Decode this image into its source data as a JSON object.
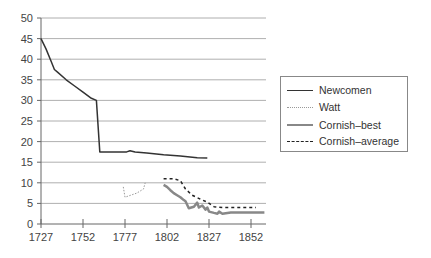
{
  "chart_data": {
    "type": "line",
    "title": "",
    "xlabel": "",
    "ylabel": "",
    "xlim": [
      1727,
      1860
    ],
    "ylim": [
      0,
      50
    ],
    "grid": true,
    "legend_position": "right",
    "x_ticks": [
      "1727",
      "1752",
      "1777",
      "1802",
      "1827",
      "1852"
    ],
    "y_ticks": [
      "0",
      "5",
      "10",
      "15",
      "20",
      "25",
      "30",
      "35",
      "40",
      "45",
      "50"
    ],
    "series": [
      {
        "name": "Newcomen",
        "style": "solid",
        "color": "#333333",
        "points": [
          [
            1727,
            45
          ],
          [
            1730,
            42.5
          ],
          [
            1733,
            39.5
          ],
          [
            1735,
            37.5
          ],
          [
            1737,
            36.8
          ],
          [
            1742,
            35
          ],
          [
            1747,
            33.5
          ],
          [
            1752,
            32
          ],
          [
            1757,
            30.5
          ],
          [
            1760,
            30
          ],
          [
            1762,
            17.5
          ],
          [
            1770,
            17.5
          ],
          [
            1778,
            17.5
          ],
          [
            1780,
            17.8
          ],
          [
            1783,
            17.5
          ],
          [
            1790,
            17.2
          ],
          [
            1800,
            16.8
          ],
          [
            1810,
            16.5
          ],
          [
            1820,
            16.1
          ],
          [
            1826,
            16
          ]
        ]
      },
      {
        "name": "Watt",
        "style": "dotted",
        "color": "#999999",
        "points": [
          [
            1776,
            9
          ],
          [
            1777,
            6.5
          ],
          [
            1784,
            7.5
          ],
          [
            1788,
            8.5
          ],
          [
            1789,
            10
          ]
        ]
      },
      {
        "name": "Cornish–best",
        "style": "solid-thick",
        "color": "#888888",
        "points": [
          [
            1800,
            9.5
          ],
          [
            1802,
            9
          ],
          [
            1804,
            8.2
          ],
          [
            1806,
            7.5
          ],
          [
            1808,
            7
          ],
          [
            1810,
            6.5
          ],
          [
            1812,
            5.8
          ],
          [
            1813,
            5.5
          ],
          [
            1815,
            3.8
          ],
          [
            1818,
            4.2
          ],
          [
            1820,
            5.2
          ],
          [
            1821,
            4
          ],
          [
            1823,
            4.5
          ],
          [
            1825,
            3.5
          ],
          [
            1826,
            4
          ],
          [
            1827,
            3
          ],
          [
            1830,
            2.7
          ],
          [
            1832,
            2.5
          ],
          [
            1833,
            3
          ],
          [
            1835,
            2.5
          ],
          [
            1840,
            2.8
          ],
          [
            1850,
            2.8
          ],
          [
            1860,
            2.8
          ]
        ]
      },
      {
        "name": "Cornish–average",
        "style": "dashed",
        "color": "#222222",
        "points": [
          [
            1800,
            11
          ],
          [
            1806,
            11
          ],
          [
            1810,
            10.5
          ],
          [
            1813,
            8.5
          ],
          [
            1817,
            7
          ],
          [
            1822,
            6
          ],
          [
            1826,
            5.3
          ],
          [
            1830,
            4.2
          ],
          [
            1835,
            4
          ],
          [
            1845,
            4
          ],
          [
            1855,
            4
          ]
        ]
      }
    ]
  },
  "legend": {
    "items": [
      {
        "label": "Newcomen"
      },
      {
        "label": "Watt"
      },
      {
        "label": "Cornish–best"
      },
      {
        "label": "Cornish–average"
      }
    ]
  }
}
